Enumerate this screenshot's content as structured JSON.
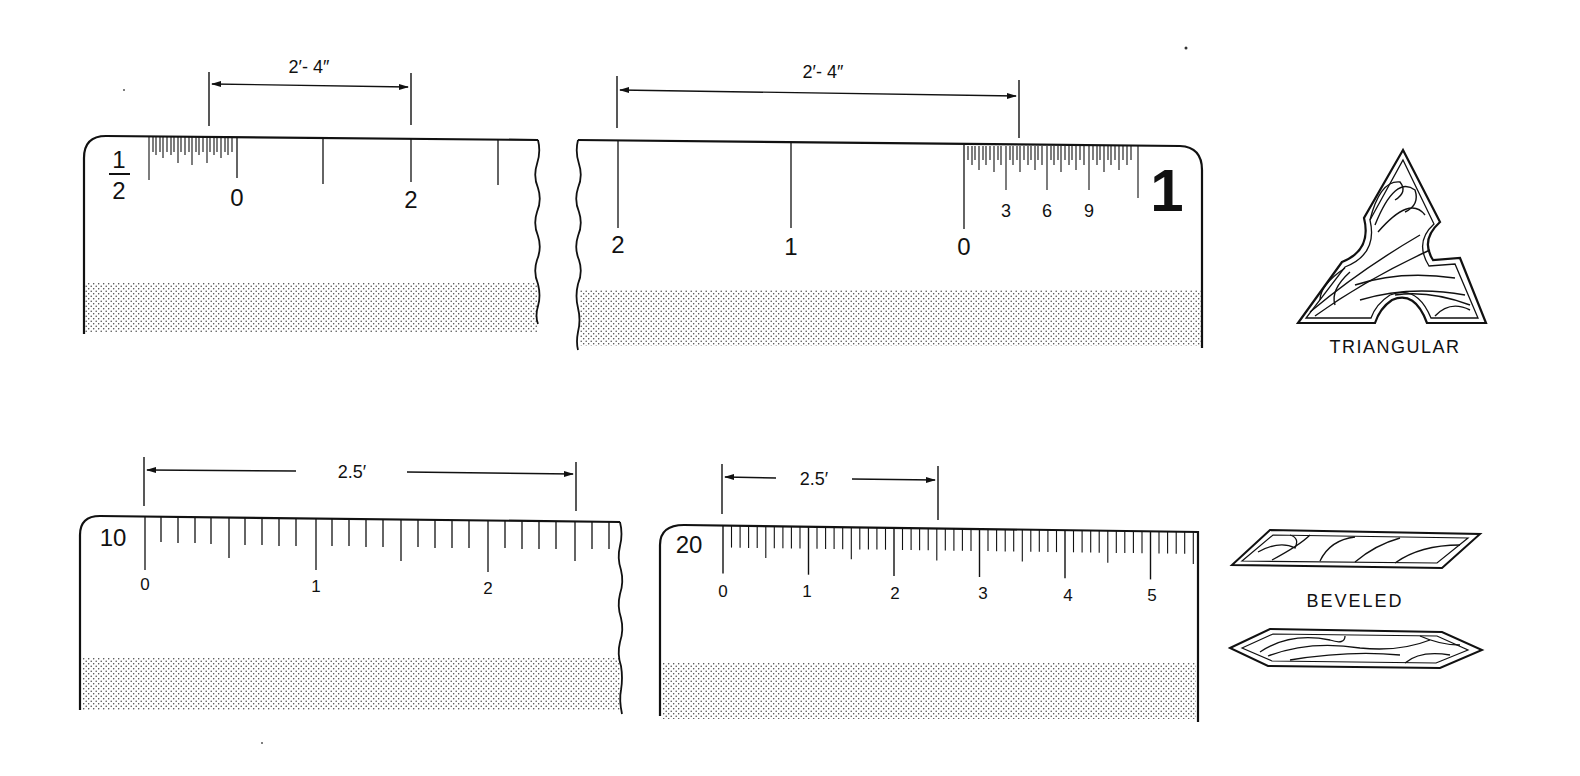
{
  "colors": {
    "ink": "#111111",
    "paper": "#ffffff",
    "stipple": "#444444"
  },
  "scales": {
    "half_inch": {
      "scale_label_num": "1",
      "scale_label_den": "2",
      "dimension": "2′- 4″",
      "tick_labels": [
        "0",
        "2"
      ],
      "description": "1/2 inch architect scale, reading 2'-4\""
    },
    "one_inch": {
      "scale_label": "1",
      "dimension": "2′- 4″",
      "tick_labels": [
        "2",
        "1",
        "0"
      ],
      "inch_labels": [
        "3",
        "6",
        "9"
      ],
      "description": "1 inch architect scale (reversed), reading 2'-4\""
    },
    "ten": {
      "scale_label": "10",
      "dimension": "2.5′",
      "tick_labels": [
        "0",
        "1",
        "2"
      ],
      "description": "Engineer scale 10, reading 2.5'"
    },
    "twenty": {
      "scale_label": "20",
      "dimension": "2.5′",
      "tick_labels": [
        "0",
        "1",
        "2",
        "3",
        "4",
        "5"
      ],
      "description": "Engineer scale 20, reading 2.5'"
    }
  },
  "cross_sections": {
    "triangular": {
      "label": "TRIANGULAR"
    },
    "beveled": {
      "label": "BEVELED"
    }
  }
}
